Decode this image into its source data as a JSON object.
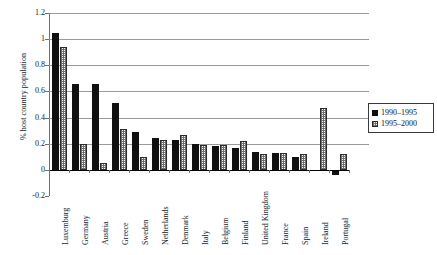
{
  "chart_data": {
    "type": "bar",
    "title": "",
    "xlabel": "",
    "ylabel": "% host country population",
    "ylim": [
      -0.2,
      1.2
    ],
    "ytick_step": 0.2,
    "yticks": [
      "1.2",
      "1",
      "0.8",
      "0.6",
      "0.4",
      "0.2",
      "0",
      "-0.2"
    ],
    "ytick_values": [
      1.2,
      1,
      0.8,
      0.6,
      0.4,
      0.2,
      0,
      -0.2
    ],
    "grid": "horizontal",
    "legend_position": "right",
    "categories": [
      "Luxemburg",
      "Germany",
      "Austria",
      "Greece",
      "Sweden",
      "Netherlands",
      "Denmark",
      "Italy",
      "Belgium",
      "Finland",
      "United Kingdom",
      "France",
      "Spain",
      "Ireland",
      "Portugal"
    ],
    "series": [
      {
        "name": "1990–1995",
        "fill": "solid-black",
        "color": "#101010",
        "values": [
          1.05,
          0.66,
          0.66,
          0.51,
          0.29,
          0.24,
          0.23,
          0.2,
          0.18,
          0.17,
          0.14,
          0.13,
          0.1,
          0.0,
          -0.04
        ]
      },
      {
        "name": "1995–2000",
        "fill": "checkered-gray",
        "color": "#6e6e6e",
        "values": [
          0.94,
          0.2,
          0.05,
          0.31,
          0.1,
          0.23,
          0.27,
          0.19,
          0.19,
          0.22,
          0.12,
          0.13,
          0.12,
          0.47,
          0.12
        ]
      }
    ]
  },
  "legend": {
    "items": [
      {
        "label": "1990–1995",
        "swatch": "solid-black"
      },
      {
        "label": "1995–2000",
        "swatch": "checkered-gray"
      }
    ]
  },
  "caption": {
    "text": ""
  }
}
